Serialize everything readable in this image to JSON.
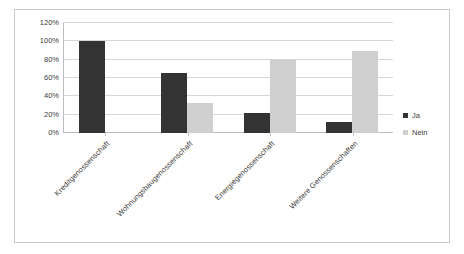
{
  "chart_data": {
    "type": "bar",
    "title": "",
    "subtitle": "",
    "xlabel": "",
    "ylabel": "",
    "categories": [
      "Kreditgenossenschaft",
      "Wohnungsbaugenossenschaft",
      "Energiegenossenschaft",
      "Weitere Genossenschaften"
    ],
    "series": [
      {
        "name": "Ja",
        "color": "#333333",
        "values": [
          100,
          66,
          22,
          12
        ]
      },
      {
        "name": "Nein",
        "color": "#cfcfcf",
        "values": [
          0,
          33,
          80,
          89
        ]
      }
    ],
    "ylim": [
      0,
      120
    ],
    "yticks": [
      0,
      20,
      40,
      60,
      80,
      100,
      120
    ],
    "ytick_labels": [
      "0%",
      "20%",
      "40%",
      "60%",
      "80%",
      "100%",
      "120%"
    ],
    "grid": true,
    "grid_axis": "y",
    "legend_position": "right",
    "bar_mode": "grouped"
  },
  "legend": {
    "entries": [
      {
        "label": "Ja"
      },
      {
        "label": "Nein"
      }
    ]
  },
  "colors": {
    "series_ja": "#333333",
    "series_nein": "#cfcfcf",
    "gridline": "#d6d6d6",
    "axis": "#bdbdbd",
    "frame_border": "#c9c9c9",
    "background": "#ffffff",
    "text": "#3a3a3a"
  }
}
